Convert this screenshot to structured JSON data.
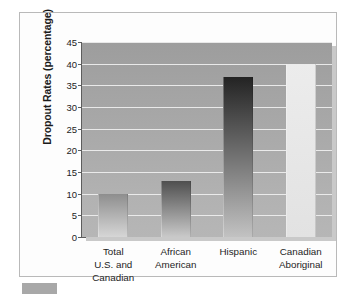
{
  "chart_data": {
    "type": "bar",
    "title": "",
    "subtitle": "",
    "xlabel": "",
    "ylabel": "Dropout Rates (percentage)",
    "categories": [
      "Total\nU.S. and\nCanadian",
      "African\nAmerican",
      "Hispanic",
      "Canadian\nAboriginal"
    ],
    "category_lines": [
      [
        "Total",
        "U.S. and",
        "Canadian"
      ],
      [
        "African",
        "American"
      ],
      [
        "Hispanic"
      ],
      [
        "Canadian",
        "Aboriginal"
      ]
    ],
    "values": [
      10,
      13,
      37,
      40
    ],
    "ylim": [
      0,
      45
    ],
    "ytick_step": 5,
    "yticks": [
      0,
      5,
      10,
      15,
      20,
      25,
      30,
      35,
      40,
      45
    ],
    "ytick_labels": [
      "0",
      "5",
      "10",
      "15",
      "20",
      "25",
      "30",
      "35",
      "40",
      "45"
    ],
    "grid": true,
    "grid_orientation": "horizontal",
    "legend": false,
    "legend_position": "none",
    "bar_styles": [
      {
        "name": "total-us-and-canadian",
        "top_color": "#8e8e8e",
        "bottom_color": "#d6d6d6",
        "gradient": "vertical"
      },
      {
        "name": "african-american",
        "top_color": "#4f4f4f",
        "bottom_color": "#c9c9c9",
        "gradient": "vertical"
      },
      {
        "name": "hispanic",
        "top_color": "#232323",
        "bottom_color": "#c2c2c2",
        "gradient": "vertical"
      },
      {
        "name": "canadian-aboriginal",
        "top_color": "#ececec",
        "bottom_color": "#e2e2e2",
        "gradient": "vertical"
      }
    ]
  },
  "colors": {
    "plot_background_top": "#9d9d9d",
    "plot_background_bottom": "#b6b6b6",
    "gridline": "#efefef",
    "axis_line": "#5d5d5d",
    "frame_border": "#b9b9b9",
    "page_background": "#ffffff",
    "text": "#1d1d1d",
    "shadow": "#c9c9c9",
    "corner_block": "#a8a8a8"
  }
}
